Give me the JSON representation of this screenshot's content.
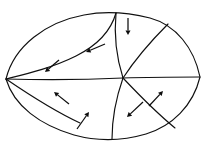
{
  "figure": {
    "type": "vector-field-sector-diagram",
    "canvas": {
      "width": 205,
      "height": 147
    },
    "colors": {
      "background": "#ffffff",
      "stroke": "#101010",
      "arrow": "#0d0d0d"
    },
    "singular_point": {
      "x": 123,
      "y": 78,
      "label": ""
    },
    "boundary": {
      "name": "outer-lens-boundary",
      "description": "Closed lens (vesica) shaped outline, pointed at left and right tips",
      "left_tip": {
        "x": 6,
        "y": 79
      },
      "right_tip": {
        "x": 200,
        "y": 77
      },
      "top_extreme": {
        "x": 110,
        "y": 13
      },
      "bottom_extreme": {
        "x": 108,
        "y": 139
      },
      "path": "M 6,79 C 14,46 46,22 84,15 C 104,11 126,12 150,18 C 176,25 194,48 200,77 C 193,106 172,126 146,134 C 122,141 96,141 74,135 C 40,125 14,106 6,79 Z"
    },
    "separatrices": [
      {
        "name": "separatrix-upper-left",
        "path": "M 6,79 C 26,74 52,68 76,56 C 94,47 110,34 116,13",
        "from": "left-tip",
        "to": "top-boundary"
      },
      {
        "name": "separatrix-horizontal-left",
        "path": "M 6,79 C 40,80 82,80 123,78",
        "from": "left-tip",
        "to": "singular-point"
      },
      {
        "name": "separatrix-top-center",
        "path": "M 116,13 C 114,34 116,56 123,78",
        "from": "top-boundary",
        "to": "singular-point"
      },
      {
        "name": "separatrix-upper-right",
        "path": "M 123,78 C 136,58 152,40 168,24",
        "from": "singular-point",
        "to": "upper-right-boundary"
      },
      {
        "name": "separatrix-horizontal-right",
        "path": "M 123,78 C 152,77 178,77 200,77",
        "from": "singular-point",
        "to": "right-tip"
      },
      {
        "name": "separatrix-lower-left-diagonal",
        "path": "M 6,79 C 28,94 52,110 80,123",
        "from": "left-tip",
        "to": "lower-left-boundary"
      },
      {
        "name": "separatrix-bottom-center",
        "path": "M 123,78 C 116,98 112,118 112,139",
        "from": "singular-point",
        "to": "bottom-boundary"
      },
      {
        "name": "separatrix-lower-right",
        "path": "M 123,78 C 140,96 158,114 175,128",
        "from": "singular-point",
        "to": "lower-right-boundary"
      }
    ],
    "arrows": [
      {
        "name": "arrow-top-down",
        "tail": {
          "x": 128,
          "y": 18
        },
        "tip": {
          "x": 128,
          "y": 35
        },
        "direction": "down"
      },
      {
        "name": "arrow-upper-center-left",
        "tail": {
          "x": 105,
          "y": 44
        },
        "tip": {
          "x": 86,
          "y": 52
        },
        "direction": "left"
      },
      {
        "name": "arrow-upper-left-downleft",
        "tail": {
          "x": 59,
          "y": 60
        },
        "tip": {
          "x": 45,
          "y": 72
        },
        "direction": "down-left"
      },
      {
        "name": "arrow-lower-left-upleft",
        "tail": {
          "x": 69,
          "y": 104
        },
        "tip": {
          "x": 54,
          "y": 92
        },
        "direction": "up-left"
      },
      {
        "name": "arrow-bottom-center-upright",
        "tail": {
          "x": 77,
          "y": 129
        },
        "tip": {
          "x": 89,
          "y": 112
        },
        "direction": "up-right"
      },
      {
        "name": "arrow-lower-center-downleft",
        "tail": {
          "x": 143,
          "y": 102
        },
        "tip": {
          "x": 127,
          "y": 117
        },
        "direction": "down-left"
      },
      {
        "name": "arrow-lower-right-upright",
        "tail": {
          "x": 149,
          "y": 106
        },
        "tip": {
          "x": 163,
          "y": 91
        },
        "direction": "up-right"
      }
    ]
  }
}
